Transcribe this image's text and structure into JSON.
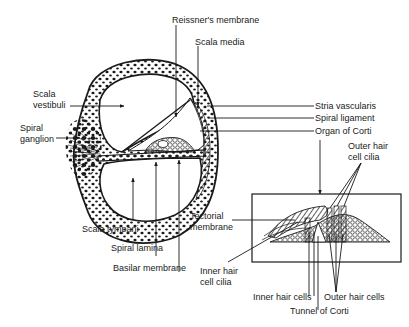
{
  "figure": {
    "colors": {
      "ink": "#1a1a1a",
      "background": "#ffffff"
    }
  },
  "cochlea_labels": {
    "reissners_membrane": "Reissner's membrane",
    "scala_media": "Scala media",
    "scala_vestibuli_line1": "Scala",
    "scala_vestibuli_line2": "vestibuli",
    "spiral_ganglion_line1": "Spiral",
    "spiral_ganglion_line2": "ganglion",
    "stria_vascularis": "Stria vascularis",
    "spiral_ligament": "Spiral ligament",
    "organ_of_corti": "Organ of Corti",
    "scala_tympani": "Scala tympani",
    "spiral_lamina": "Spiral lamina",
    "basilar_membrane": "Basilar membrane"
  },
  "inset_labels": {
    "outer_hair_cell_cilia_line1": "Outer hair",
    "outer_hair_cell_cilia_line2": "cell cilia",
    "tectorial_membrane_line1": "Tectorial",
    "tectorial_membrane_line2": "membrane",
    "inner_hair_cell_cilia_line1": "Inner hair",
    "inner_hair_cell_cilia_line2": "cell cilia",
    "inner_hair_cells": "Inner hair cells",
    "outer_hair_cells": "Outer hair cells",
    "tunnel_of_corti": "Tunnel of Corti"
  }
}
